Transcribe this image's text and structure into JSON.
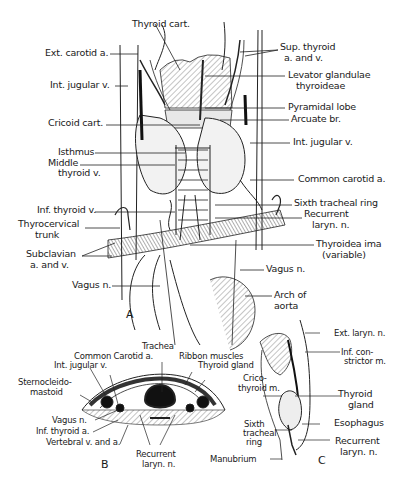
{
  "figure": {
    "panels": [
      "A",
      "B",
      "C"
    ]
  },
  "panel_a": {
    "labels_left": [
      "Ext. carotid a.",
      "Int. jugular v.",
      "Cricoid cart.",
      "Isthmus",
      "Middle",
      "thyroid v.",
      "Inf. thyroid v.",
      "Thyrocervical",
      "trunk",
      "Subclavian",
      "a. and v.",
      "Vagus n."
    ],
    "labels_top": [
      "Thyroid cart."
    ],
    "labels_right": [
      "Sup. thyroid",
      "a. and v.",
      "Levator glandulae",
      "thyroideae",
      "Pyramidal lobe",
      "Arcuate br.",
      "Int. jugular v.",
      "Common carotid a.",
      "Sixth tracheal ring",
      "Recurrent",
      "laryn. n.",
      "Thyroidea ima",
      "(variable)",
      "Vagus n.",
      "Arch of",
      "aorta"
    ]
  },
  "panel_b": {
    "labels": [
      "Trachea",
      "Common Carotid a.",
      "Int. jugular v.",
      "Ribbon muscles",
      "Thyroid gland",
      "Sternocleido-",
      "mastoid",
      "Vagus n.",
      "Inf. thyroid a.",
      "Vertebral v. and a.",
      "Recurrent",
      "laryn. n."
    ]
  },
  "panel_c": {
    "labels": [
      "Ext. laryn. n.",
      "Inf. con-",
      "strictor m.",
      "Crico-",
      "thyroid m.",
      "Thyroid",
      "gland",
      "Esophagus",
      "Sixth",
      "tracheal",
      "ring",
      "Recurrent",
      "laryn. n.",
      "Manubrium"
    ]
  }
}
